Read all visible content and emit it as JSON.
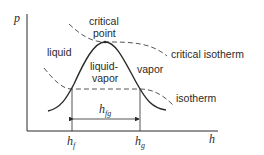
{
  "diagram": {
    "axes": {
      "y_label": "p",
      "x_label": "h"
    },
    "regions": {
      "liquid": "liquid",
      "liquid_vapor_line1": "liquid-",
      "liquid_vapor_line2": "vapor",
      "vapor": "vapor"
    },
    "critical_point": {
      "line1": "critical",
      "line2": "point"
    },
    "curves": {
      "critical_isotherm": "critical isotherm",
      "isotherm": "isotherm"
    },
    "x_ticks": {
      "hf_base": "h",
      "hf_sub": "f",
      "hg_base": "h",
      "hg_sub": "g"
    },
    "span_label": {
      "base": "h",
      "sub": "fg"
    },
    "colors": {
      "line": "#2a2a2a",
      "background": "#ffffff"
    }
  }
}
